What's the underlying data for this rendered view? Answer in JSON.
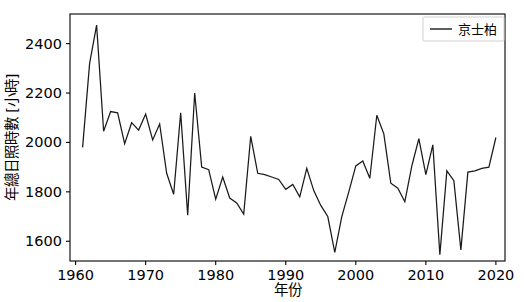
{
  "chart_data": {
    "type": "line",
    "title": "",
    "xlabel": "年份",
    "ylabel": "年總日照時數 [小時]",
    "xlim": [
      1959.2,
      2021.3
    ],
    "ylim": [
      1520,
      2520
    ],
    "xticks": [
      1960,
      1970,
      1980,
      1990,
      2000,
      2010,
      2020
    ],
    "xtick_labels": [
      "1960",
      "1970",
      "1980",
      "1990",
      "2000",
      "2010",
      "2020"
    ],
    "yticks": [
      1600,
      1800,
      2000,
      2200,
      2400
    ],
    "ytick_labels": [
      "1600",
      "1800",
      "2000",
      "2200",
      "2400"
    ],
    "grid": false,
    "legend_position": "upper right",
    "line_color": "#1a1a1a",
    "series": [
      {
        "name": "京士柏",
        "x": [
          1961,
          1962,
          1963,
          1964,
          1965,
          1966,
          1967,
          1968,
          1969,
          1970,
          1971,
          1972,
          1973,
          1974,
          1975,
          1976,
          1977,
          1978,
          1979,
          1980,
          1981,
          1982,
          1983,
          1984,
          1985,
          1986,
          1987,
          1988,
          1989,
          1990,
          1991,
          1992,
          1993,
          1994,
          1995,
          1996,
          1997,
          1998,
          1999,
          2000,
          2001,
          2002,
          2003,
          2004,
          2005,
          2006,
          2007,
          2008,
          2009,
          2010,
          2011,
          2012,
          2013,
          2014,
          2015,
          2016,
          2017,
          2018,
          2019,
          2020
        ],
        "values": [
          1980,
          2320,
          2475,
          2045,
          2125,
          2120,
          1995,
          2080,
          2050,
          2115,
          2010,
          2075,
          1875,
          1790,
          2120,
          1705,
          2200,
          1900,
          1890,
          1770,
          1860,
          1775,
          1755,
          1710,
          2025,
          1875,
          1870,
          1860,
          1850,
          1810,
          1830,
          1780,
          1895,
          1805,
          1745,
          1700,
          1555,
          1700,
          1800,
          1905,
          1925,
          1855,
          2110,
          2035,
          1835,
          1815,
          1760,
          1905,
          2015,
          1870,
          1990,
          1545,
          1885,
          1845,
          1565,
          1880,
          1885,
          1895,
          1900,
          2020
        ]
      }
    ]
  },
  "legend": {
    "entries": [
      "京士柏"
    ]
  }
}
